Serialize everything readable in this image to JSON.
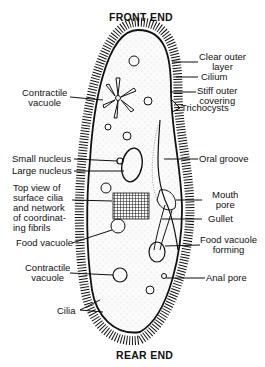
{
  "title_top": "FRONT END",
  "title_bottom": "REAR END",
  "labels": {
    "clear_outer_layer_1": "Clear outer",
    "clear_outer_layer_2": "layer",
    "cilium": "Cilium",
    "stiff_1": "Stiff outer",
    "stiff_2": "covering",
    "trichocysts": "Trichocysts",
    "contractile_top_1": "Contractile",
    "contractile_top_2": "vacuole",
    "small_nucleus": "Small nucleus",
    "large_nucleus": "Large nucleus",
    "top_view_1": "Top view of",
    "top_view_2": "surface cilia",
    "top_view_3": "and network",
    "top_view_4": "of coordinat-",
    "top_view_5": "ing fibrils",
    "food_vacuole": "Food vacuole",
    "oral_groove": "Oral groove",
    "mouth_1": "Mouth",
    "mouth_2": "pore",
    "gullet": "Gullet",
    "fv_forming_1": "Food vacuole",
    "fv_forming_2": "forming",
    "contractile_bottom_1": "Contractile",
    "contractile_bottom_2": "vacuole",
    "anal_pore": "Anal pore",
    "cilia": "Cilia"
  }
}
